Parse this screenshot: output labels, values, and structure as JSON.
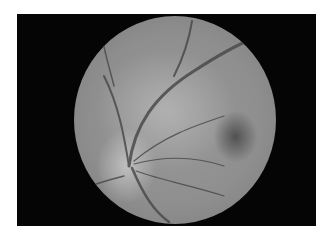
{
  "image": {
    "subject": "retinal fundus photograph (grayscale)",
    "background_color": "#ffffff",
    "frame_color": "#050505",
    "features": [
      "optic-disc",
      "macula",
      "retinal-vessels"
    ]
  }
}
